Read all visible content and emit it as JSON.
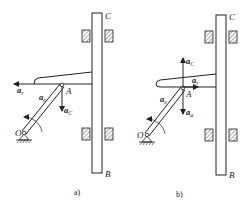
{
  "figure": {
    "panels": [
      {
        "id": "a",
        "caption": "a)",
        "points": {
          "O": "O",
          "A": "A",
          "C": "C",
          "B": "B"
        },
        "vectors": [
          {
            "name": "a_r",
            "base": "a",
            "sub": "r",
            "direction": "left"
          },
          {
            "name": "a_e",
            "base": "a",
            "sub": "e",
            "direction": "along-crank"
          },
          {
            "name": "a_C",
            "base": "a",
            "sub": "C",
            "direction": "down"
          }
        ]
      },
      {
        "id": "b",
        "caption": "b)",
        "points": {
          "O": "O",
          "A": "A",
          "C": "C",
          "B": "B"
        },
        "vectors": [
          {
            "name": "a_C",
            "base": "a",
            "sub": "C",
            "direction": "up"
          },
          {
            "name": "a_r",
            "base": "a",
            "sub": "r",
            "direction": "right"
          },
          {
            "name": "a_e",
            "base": "a",
            "sub": "e",
            "direction": "along-crank"
          },
          {
            "name": "a_a",
            "base": "a",
            "sub": "a",
            "direction": "down"
          }
        ]
      }
    ],
    "colors": {
      "ink": "#222222",
      "hatch": "#555555"
    }
  }
}
